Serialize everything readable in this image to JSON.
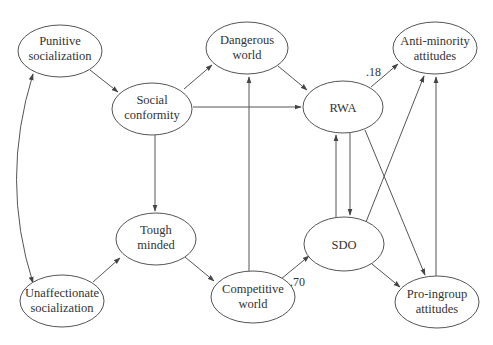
{
  "diagram": {
    "type": "path-diagram",
    "nodes": [
      {
        "id": "punitive",
        "lines": [
          "Punitive",
          "socialization"
        ],
        "cx": 60,
        "cy": 51,
        "rx": 42,
        "ry": 26
      },
      {
        "id": "dangerous",
        "lines": [
          "Dangerous",
          "world"
        ],
        "cx": 247,
        "cy": 48,
        "rx": 41,
        "ry": 26
      },
      {
        "id": "antiminority",
        "lines": [
          "Anti-minority",
          "attitudes"
        ],
        "cx": 435,
        "cy": 48,
        "rx": 42,
        "ry": 26
      },
      {
        "id": "conformity",
        "lines": [
          "Social",
          "conformity"
        ],
        "cx": 152,
        "cy": 136,
        "rx": 40,
        "ry": 26
      },
      {
        "id": "rwa",
        "lines": [
          "RWA"
        ],
        "cx": 343,
        "cy": 107,
        "rx": 40,
        "ry": 26
      },
      {
        "id": "tough",
        "lines": [
          "Tough",
          "minded"
        ],
        "cx": 156,
        "cy": 239,
        "rx": 40,
        "ry": 26
      },
      {
        "id": "sdo",
        "lines": [
          "SDO"
        ],
        "cx": 344,
        "cy": 244,
        "rx": 40,
        "ry": 27
      },
      {
        "id": "unaffectionate",
        "lines": [
          "Unaffectionate",
          "socialization"
        ],
        "cx": 62,
        "cy": 301,
        "rx": 42,
        "ry": 26
      },
      {
        "id": "competitive",
        "lines": [
          "Competitive",
          "world"
        ],
        "cx": 253,
        "cy": 297,
        "rx": 42,
        "ry": 26
      },
      {
        "id": "proingroup",
        "lines": [
          "Pro-ingroup",
          "attitudes"
        ],
        "cx": 437,
        "cy": 302,
        "rx": 42,
        "ry": 26
      }
    ],
    "edges": [
      {
        "from": "punitive",
        "to": "conformity",
        "label": ""
      },
      {
        "from": "conformity",
        "to": "dangerous",
        "label": ""
      },
      {
        "from": "conformity",
        "to": "rwa",
        "label": ""
      },
      {
        "from": "conformity",
        "to": "tough",
        "label": ""
      },
      {
        "from": "dangerous",
        "to": "rwa",
        "label": ""
      },
      {
        "from": "rwa",
        "to": "antiminority",
        "label": ".18"
      },
      {
        "from": "rwa",
        "to": "sdo",
        "label": ""
      },
      {
        "from": "sdo",
        "to": "rwa",
        "label": ""
      },
      {
        "from": "rwa",
        "to": "proingroup",
        "label": ""
      },
      {
        "from": "sdo",
        "to": "antiminority",
        "label": ""
      },
      {
        "from": "sdo",
        "to": "proingroup",
        "label": ""
      },
      {
        "from": "proingroup",
        "to": "antiminority",
        "label": ""
      },
      {
        "from": "unaffectionate",
        "to": "tough",
        "label": ""
      },
      {
        "from": "tough",
        "to": "competitive",
        "label": ""
      },
      {
        "from": "competitive",
        "to": "dangerous",
        "label": ""
      },
      {
        "from": "competitive",
        "to": "sdo",
        "label": ".70"
      },
      {
        "from": "punitive",
        "to": "unaffectionate",
        "label": "",
        "bidirectional": true,
        "curved": true
      }
    ],
    "edge_labels": {
      "rwa_antiminority": ".18",
      "competitive_sdo": ".70"
    }
  }
}
